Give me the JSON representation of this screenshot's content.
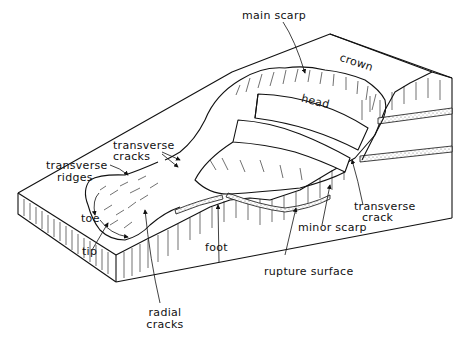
{
  "diagram": {
    "colors": {
      "ink": "#111111",
      "background": "#ffffff",
      "stipple": "#9a9a9a"
    },
    "labels": {
      "main_scarp": "main scarp",
      "crown": "crown",
      "head": "head",
      "transverse_cracks_1": "transverse",
      "transverse_cracks_2": "cracks",
      "transverse_ridges_1": "transverse",
      "transverse_ridges_2": "ridges",
      "toe": "toe",
      "tip": "tip",
      "foot": "foot",
      "radial_cracks_1": "radial",
      "radial_cracks_2": "cracks",
      "minor_scarp": "minor scarp",
      "transverse_crack_1": "transverse",
      "transverse_crack_2": "crack",
      "rupture_surface": "rupture surface"
    }
  }
}
